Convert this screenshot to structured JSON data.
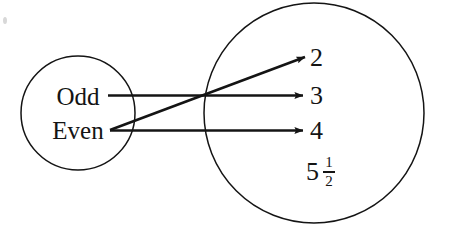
{
  "diagram": {
    "type": "mapping-arrow-diagram",
    "stroke_color": "#141414",
    "background_color": "#ffffff",
    "domain_set": {
      "name": "left-circle",
      "center_x": 78,
      "center_y": 113,
      "radius": 57,
      "members": [
        {
          "id": "odd",
          "label": "Odd"
        },
        {
          "id": "even",
          "label": "Even"
        }
      ]
    },
    "codomain_set": {
      "name": "right-circle",
      "center_x": 314,
      "center_y": 113,
      "radius": 110,
      "members": [
        {
          "id": "two",
          "label": "2"
        },
        {
          "id": "three",
          "label": "3"
        },
        {
          "id": "four",
          "label": "4"
        },
        {
          "id": "mixed",
          "label": "5 1/2",
          "whole": "5",
          "numerator": "1",
          "denominator": "2"
        }
      ]
    },
    "arrows": [
      {
        "id": "odd-to-three",
        "from": "Odd",
        "to": "3"
      },
      {
        "id": "even-to-two",
        "from": "Even",
        "to": "2"
      },
      {
        "id": "even-to-four",
        "from": "Even",
        "to": "4"
      }
    ]
  }
}
